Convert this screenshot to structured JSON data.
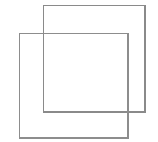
{
  "figure": {
    "background_color": "#ffffff",
    "canvas": {
      "width": 158,
      "height": 142
    },
    "stroke_color": "#8a8a8a",
    "stroke_width": 1.4,
    "fill": "none",
    "shapes": [
      {
        "name": "upper-right-square",
        "kind": "square",
        "x": 43.5,
        "y": 5.5,
        "width": 101.5,
        "height": 106.5,
        "stroke": "#8a8a8a",
        "fill": "none",
        "label": "Upper right square"
      },
      {
        "name": "lower-left-square",
        "kind": "square",
        "x": 19.5,
        "y": 33.5,
        "width": 108.5,
        "height": 104.5,
        "stroke": "#8d8d8d",
        "fill": "none",
        "label": "Lower left square"
      }
    ],
    "overlap_region": {
      "x": 43.5,
      "y": 33.5,
      "width": 84.5,
      "height": 78.5,
      "label": "Intersection of the two squares"
    }
  }
}
